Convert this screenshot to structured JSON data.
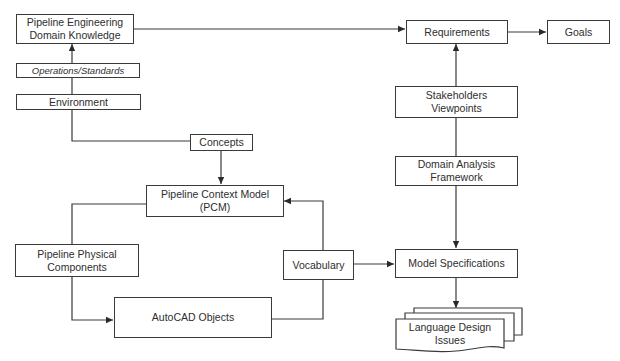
{
  "diagram": {
    "nodes": {
      "domain_knowledge": {
        "label": "Pipeline Engineering\nDomain Knowledge"
      },
      "operations_standards": {
        "label": "Operations/Standards"
      },
      "environment": {
        "label": "Environment"
      },
      "concepts": {
        "label": "Concepts"
      },
      "pcm": {
        "label": "Pipeline Context Model\n(PCM)"
      },
      "physical_components": {
        "label": "Pipeline Physical\nComponents"
      },
      "autocad_objects": {
        "label": "AutoCAD Objects"
      },
      "vocabulary": {
        "label": "Vocabulary"
      },
      "requirements": {
        "label": "Requirements"
      },
      "goals": {
        "label": "Goals"
      },
      "stakeholders": {
        "label": "Stakeholders\nViewpoints"
      },
      "domain_analysis": {
        "label": "Domain Analysis\nFramework"
      },
      "model_specifications": {
        "label": "Model Specifications"
      },
      "language_design_issues": {
        "label": "Language Design\nIssues"
      }
    },
    "edges": [
      {
        "from": "operations_standards",
        "to": "domain_knowledge",
        "arrow": true
      },
      {
        "from": "environment",
        "to": "operations_standards",
        "arrow": false
      },
      {
        "from": "environment",
        "to": "concepts",
        "arrow": false
      },
      {
        "from": "domain_knowledge",
        "to": "requirements",
        "arrow": true
      },
      {
        "from": "requirements",
        "to": "goals",
        "arrow": true
      },
      {
        "from": "stakeholders",
        "to": "requirements",
        "arrow": true
      },
      {
        "from": "domain_analysis",
        "to": "stakeholders",
        "arrow": false
      },
      {
        "from": "domain_analysis",
        "to": "model_specifications",
        "arrow": true
      },
      {
        "from": "concepts",
        "to": "pcm",
        "arrow": true
      },
      {
        "from": "pcm",
        "to": "physical_components",
        "arrow": false
      },
      {
        "from": "physical_components",
        "to": "autocad_objects",
        "arrow": true
      },
      {
        "from": "autocad_objects",
        "to": "vocabulary",
        "arrow": false
      },
      {
        "from": "vocabulary",
        "to": "pcm",
        "arrow": true
      },
      {
        "from": "vocabulary",
        "to": "model_specifications",
        "arrow": true
      },
      {
        "from": "model_specifications",
        "to": "language_design_issues",
        "arrow": true
      }
    ],
    "colors": {
      "line": "#3a3a3a",
      "background": "#ffffff",
      "text": "#2e2e2e"
    }
  }
}
